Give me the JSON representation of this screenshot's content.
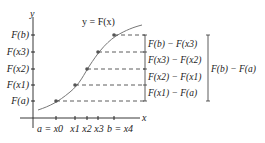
{
  "title": "y = F(x)",
  "axes": {
    "x_label": "x",
    "y_label": "y"
  },
  "y_ticks": [
    {
      "label": "F(b)",
      "y": 35
    },
    {
      "label": "F(x3)",
      "y": 52
    },
    {
      "label": "F(x2)",
      "y": 69
    },
    {
      "label": "F(x1)",
      "y": 85
    },
    {
      "label": "F(a)",
      "y": 101
    }
  ],
  "x_ticks": [
    {
      "label": "a = x0",
      "x": 56
    },
    {
      "label": "x1",
      "x": 75
    },
    {
      "label": "x2",
      "x": 87
    },
    {
      "label": "x3",
      "x": 98
    },
    {
      "label": "b = x4",
      "x": 114
    }
  ],
  "differences": [
    "F(b) − F(x3)",
    "F(x3) − F(x2)",
    "F(x2) − F(x1)",
    "F(x1) − F(a)"
  ],
  "total_difference": "F(b) − F(a)",
  "colors": {
    "curve": "#777777",
    "points": "#555555",
    "axis": "#222222"
  }
}
